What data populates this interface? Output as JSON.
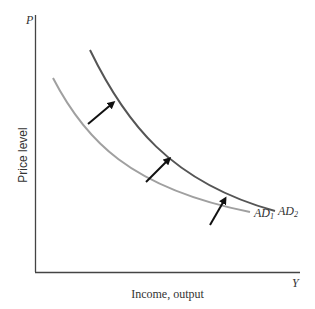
{
  "diagram": {
    "type": "economics-shift-diagram",
    "axes": {
      "y_letter": "P",
      "x_letter": "Y",
      "y_label": "Price level",
      "x_label": "Income, output"
    },
    "curves": [
      {
        "id": "AD1",
        "label_base": "AD",
        "label_sub": "1",
        "color": "#a0a0a0"
      },
      {
        "id": "AD2",
        "label_base": "AD",
        "label_sub": "2",
        "color": "#555555"
      }
    ],
    "shift_arrows": {
      "count": 3,
      "direction": "outward (up-right)",
      "color": "#111111"
    },
    "colors": {
      "axis": "#444444",
      "ad1": "#a0a0a0",
      "ad2": "#555555",
      "arrow": "#111111"
    }
  }
}
